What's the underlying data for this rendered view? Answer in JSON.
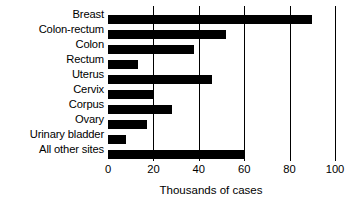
{
  "chart_data": {
    "type": "bar",
    "orientation": "horizontal",
    "title": "",
    "xlabel": "Thousands of cases",
    "ylabel": "",
    "xlim": [
      0,
      100
    ],
    "xticks": [
      0,
      20,
      40,
      60,
      80,
      100
    ],
    "xtick_labels": [
      "0",
      "20",
      "40",
      "60",
      "80",
      "100"
    ],
    "grid": true,
    "grid_axis": "x",
    "legend": false,
    "bar_color": "#000000",
    "background_color": "#ffffff",
    "categories": [
      "Breast",
      "Colon-rectum",
      "Colon",
      "Rectum",
      "Uterus",
      "Cervix",
      "Corpus",
      "Ovary",
      "Urinary bladder",
      "All other sites"
    ],
    "values": [
      90,
      52,
      38,
      13,
      46,
      20,
      28,
      17,
      8,
      60
    ]
  }
}
